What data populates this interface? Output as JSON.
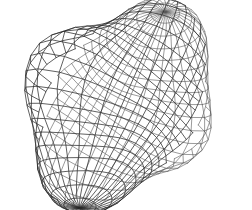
{
  "figure": {
    "kind": "3d-wireframe-mesh",
    "background_color": "#ffffff",
    "line_color": "#2b2b2b",
    "back_line_color": "#585858",
    "silhouette_color": "#1a1a1a"
  },
  "chart_data": {
    "type": "scatter",
    "title": "",
    "subtitle": "",
    "xlabel": "",
    "ylabel": "",
    "grid": false,
    "legend": "none",
    "tick_labels": [],
    "annotations": [],
    "surface": {
      "name": "four-lobed blobby implicit surface",
      "projection": "perspective",
      "lobe_count": 4,
      "mesh_u_lines": 32,
      "mesh_v_lines": 24,
      "view_rotation_deg": 38,
      "lobes": [
        {
          "label": "top-lobe",
          "center_x": 128,
          "center_y": 52,
          "radius_x": 42,
          "radius_y": 36
        },
        {
          "label": "right-lobe",
          "center_x": 198,
          "center_y": 84,
          "radius_x": 45,
          "radius_y": 32
        },
        {
          "label": "bottom-lobe",
          "center_x": 136,
          "center_y": 158,
          "radius_x": 40,
          "radius_y": 40
        },
        {
          "label": "left-lobe",
          "center_x": 52,
          "center_y": 122,
          "radius_x": 45,
          "radius_y": 33
        }
      ],
      "bounds": {
        "x_min": 10,
        "y_min": 12,
        "x_max": 241,
        "y_max": 198
      },
      "center": {
        "x": 125,
        "y": 104
      }
    }
  }
}
